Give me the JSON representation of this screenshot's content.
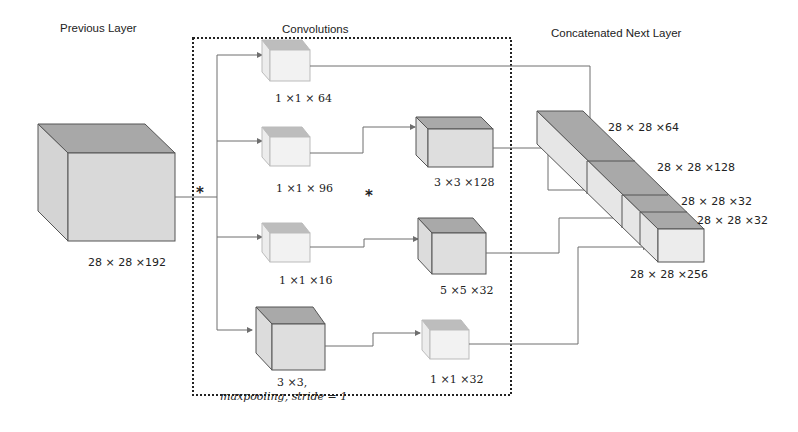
{
  "titles": {
    "previous_layer": "Previous Layer",
    "convolutions": "Convolutions",
    "concatenated": "Concatenated Next Layer"
  },
  "operator_symbol": "*",
  "input_layer": {
    "label": "28 × 28 ×192"
  },
  "branches": [
    {
      "stage1": "1 ×1 × 64"
    },
    {
      "stage1": "1 ×1 × 96",
      "stage2": "3 ×3 ×128"
    },
    {
      "stage1": "1 ×1 ×16",
      "stage2": "5 ×5 ×32"
    },
    {
      "stage1_line1": "3 ×3,",
      "stage1_line2": "maxpooling, stride = 1",
      "stage2": "1 ×1 ×32"
    }
  ],
  "output_blocks": [
    {
      "label": "28 × 28 ×64"
    },
    {
      "label": "28 × 28 ×128"
    },
    {
      "label": "28 × 28 ×32"
    },
    {
      "label": "28 × 28 ×32"
    }
  ],
  "output_total": {
    "label": "28 × 28 ×256"
  },
  "colors": {
    "cube_top_dark": "#a9a9a9",
    "cube_front": "#dcdcdc",
    "cube_side": "#cfcfcf",
    "small_cube_front": "#f1f1f1",
    "small_cube_top": "#bdbdbd",
    "edge": "#6e6e6e"
  }
}
